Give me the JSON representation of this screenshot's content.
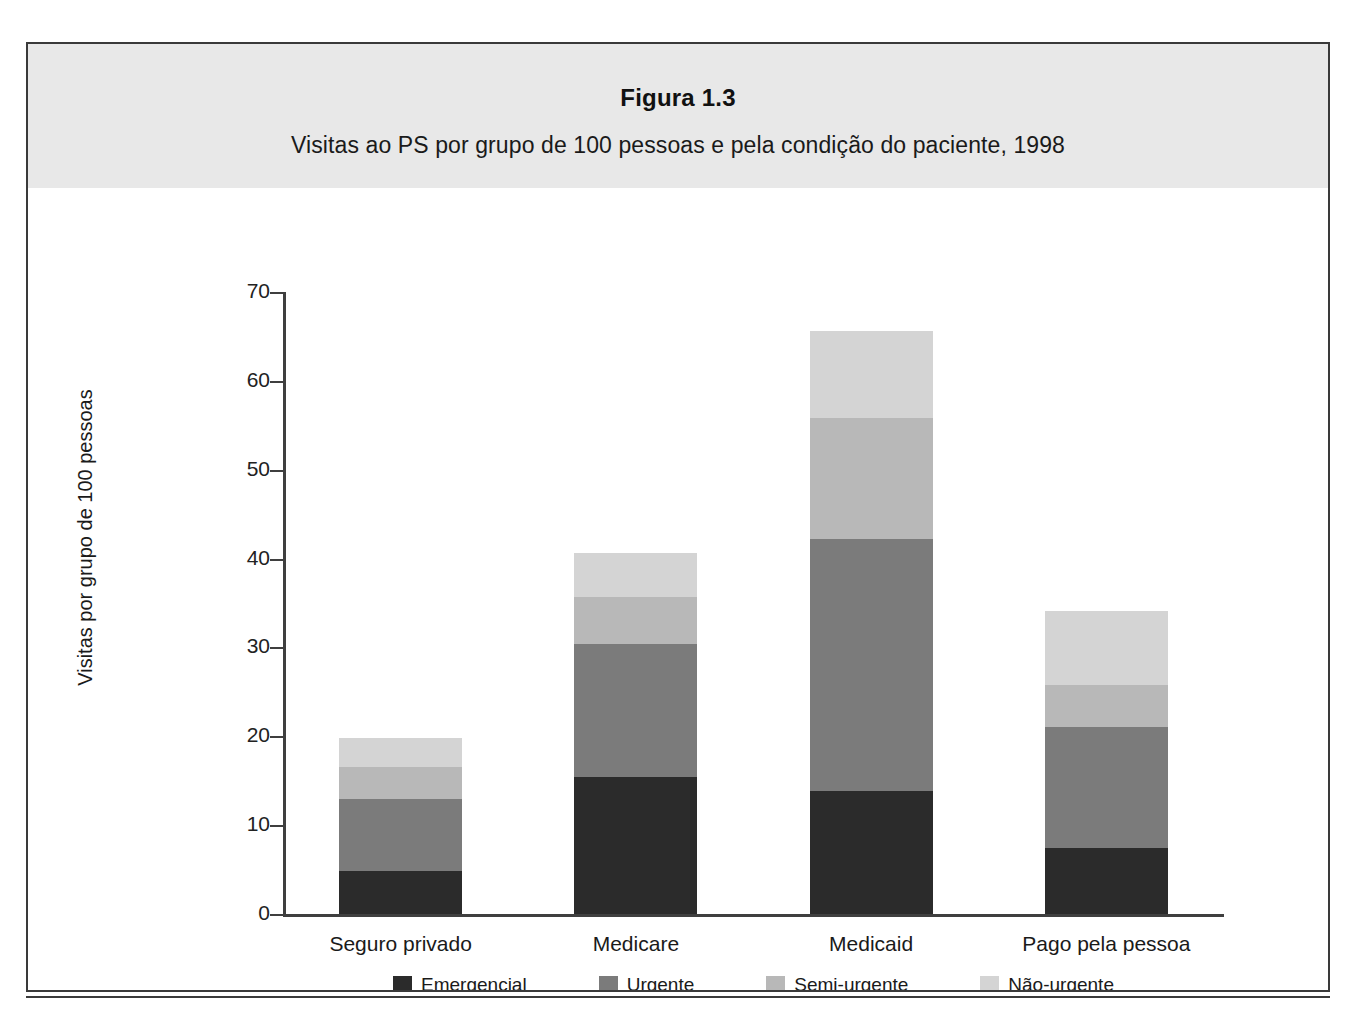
{
  "figure": {
    "number": "Figura 1.3",
    "subtitle": "Visitas ao PS por grupo de 100 pessoas e pela condição do paciente, 1998"
  },
  "colors": {
    "emergencial": "#2b2b2b",
    "urgente": "#7b7b7b",
    "semi_urgente": "#b8b8b8",
    "nao_urgente": "#d4d4d4",
    "axis": "#3f3f3f",
    "header_band": "#e8e8e8",
    "frame": "#3a3a3a"
  },
  "chart_data": {
    "type": "bar",
    "stacked": true,
    "title": "Figura 1.3",
    "subtitle": "Visitas ao PS por grupo de 100 pessoas e pela condição do paciente, 1998",
    "xlabel": "",
    "ylabel": "Visitas por grupo de 100 pessoas",
    "ylim": [
      0,
      70
    ],
    "yticks": [
      0,
      10,
      20,
      30,
      40,
      50,
      60,
      70
    ],
    "ytick_labels": [
      "0",
      "10",
      "20",
      "30",
      "40",
      "50",
      "60",
      "70"
    ],
    "grid": false,
    "legend_position": "bottom",
    "categories": [
      "Seguro privado",
      "Medicare",
      "Medicaid",
      "Pago pela pessoa"
    ],
    "series": [
      {
        "name": "Emergencial",
        "color": "#2b2b2b",
        "values": [
          4.8,
          15.4,
          13.8,
          7.4
        ]
      },
      {
        "name": "Urgente",
        "color": "#7b7b7b",
        "values": [
          8.2,
          15.0,
          28.4,
          13.7
        ]
      },
      {
        "name": "Semi-urgente",
        "color": "#b8b8b8",
        "values": [
          3.6,
          5.3,
          13.6,
          4.7
        ]
      },
      {
        "name": "Não-urgente",
        "color": "#d4d4d4",
        "values": [
          3.2,
          4.9,
          9.8,
          8.3
        ]
      }
    ],
    "totals": [
      19.8,
      40.6,
      65.6,
      34.1
    ]
  }
}
